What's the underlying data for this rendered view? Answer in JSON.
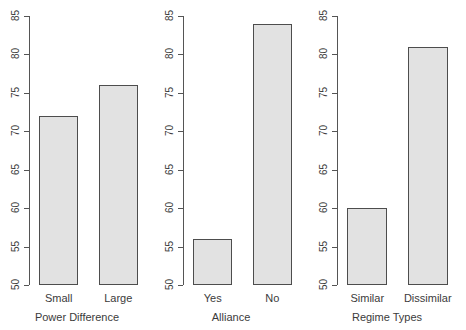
{
  "figure": {
    "background_color": "#ffffff",
    "bar_fill_color": "#e2e2e2",
    "bar_border_color": "#4d4d4d",
    "axis_color": "#555555",
    "text_color": "#3b3b3b"
  },
  "chart_data": [
    {
      "type": "bar",
      "title": "",
      "xlabel": "Power Difference",
      "ylabel": "",
      "categories": [
        "Small",
        "Large"
      ],
      "values": [
        72,
        76
      ],
      "ylim": [
        50,
        85
      ],
      "yticks": [
        50,
        55,
        60,
        65,
        70,
        75,
        80,
        85
      ],
      "ytick_labels": [
        "50",
        "55",
        "60",
        "65",
        "70",
        "75",
        "80",
        "85"
      ],
      "grid": false,
      "legend": null
    },
    {
      "type": "bar",
      "title": "",
      "xlabel": "Alliance",
      "ylabel": "",
      "categories": [
        "Yes",
        "No"
      ],
      "values": [
        56,
        84
      ],
      "ylim": [
        50,
        85
      ],
      "yticks": [
        50,
        55,
        60,
        65,
        70,
        75,
        80,
        85
      ],
      "ytick_labels": [
        "50",
        "55",
        "60",
        "65",
        "70",
        "75",
        "80",
        "85"
      ],
      "grid": false,
      "legend": null
    },
    {
      "type": "bar",
      "title": "",
      "xlabel": "Regime Types",
      "ylabel": "",
      "categories": [
        "Similar",
        "Dissimilar"
      ],
      "values": [
        60,
        81
      ],
      "ylim": [
        50,
        85
      ],
      "yticks": [
        50,
        55,
        60,
        65,
        70,
        75,
        80,
        85
      ],
      "ytick_labels": [
        "50",
        "55",
        "60",
        "65",
        "70",
        "75",
        "80",
        "85"
      ],
      "grid": false,
      "legend": null
    }
  ]
}
